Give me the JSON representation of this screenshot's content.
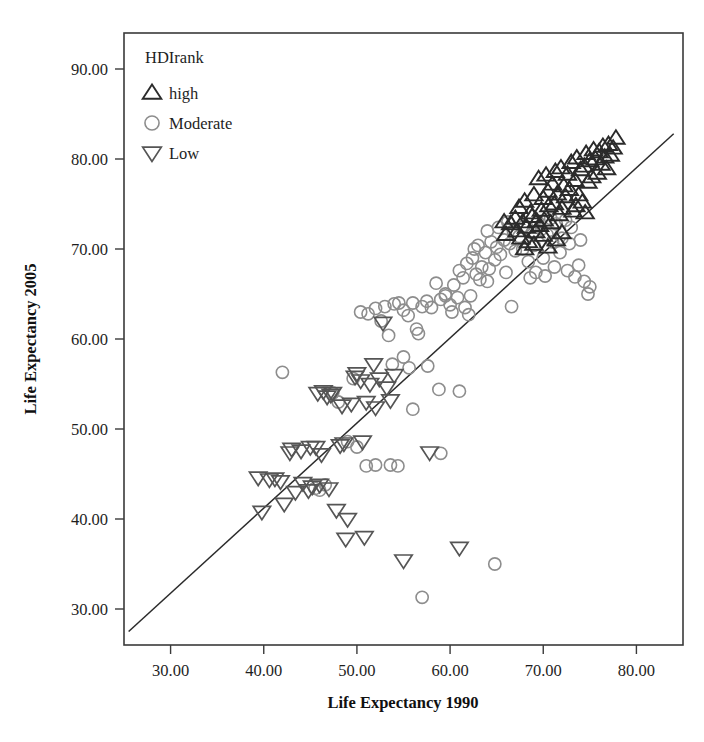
{
  "chart_data": {
    "type": "scatter",
    "title": "",
    "xlabel": "Life Expectancy 1990",
    "ylabel": "Life Expectancy 2005",
    "xlim": [
      25,
      85
    ],
    "ylim": [
      26,
      94
    ],
    "xticks": [
      "30.00",
      "40.00",
      "50.00",
      "60.00",
      "70.00",
      "80.00"
    ],
    "xtick_values": [
      30,
      40,
      50,
      60,
      70,
      80
    ],
    "yticks": [
      "30.00",
      "40.00",
      "50.00",
      "60.00",
      "70.00",
      "80.00",
      "90.00"
    ],
    "ytick_values": [
      30,
      40,
      50,
      60,
      70,
      80,
      90
    ],
    "grid": false,
    "legend": {
      "title": "HDIrank",
      "position": "top-left-inside",
      "entries": [
        {
          "label": "high",
          "marker": "triangle-up",
          "color": "#2b2b2b"
        },
        {
          "label": "Moderate",
          "marker": "circle",
          "color": "#8d8d8d"
        },
        {
          "label": "Low",
          "marker": "triangle-down",
          "color": "#555555"
        }
      ]
    },
    "reference_line": {
      "description": "y = x identity line",
      "from": [
        25.5,
        27.5
      ],
      "to": [
        84.0,
        82.8
      ]
    },
    "series": [
      {
        "name": "high",
        "marker": "triangle-up",
        "color": "#2b2b2b",
        "points": [
          [
            66.5,
            72.8
          ],
          [
            67.0,
            73.4
          ],
          [
            67.2,
            72.0
          ],
          [
            67.4,
            74.6
          ],
          [
            67.6,
            71.2
          ],
          [
            67.8,
            73.0
          ],
          [
            68.0,
            75.3
          ],
          [
            68.2,
            72.4
          ],
          [
            68.4,
            70.8
          ],
          [
            68.6,
            74.0
          ],
          [
            68.8,
            73.6
          ],
          [
            69.0,
            76.0
          ],
          [
            69.2,
            71.9
          ],
          [
            69.3,
            73.1
          ],
          [
            69.5,
            77.8
          ],
          [
            69.6,
            72.6
          ],
          [
            69.8,
            74.3
          ],
          [
            70.0,
            75.6
          ],
          [
            70.1,
            73.2
          ],
          [
            70.3,
            78.2
          ],
          [
            70.5,
            76.4
          ],
          [
            70.6,
            74.8
          ],
          [
            70.8,
            72.9
          ],
          [
            71.0,
            77.2
          ],
          [
            71.2,
            75.0
          ],
          [
            71.3,
            78.6
          ],
          [
            71.5,
            76.1
          ],
          [
            71.7,
            73.8
          ],
          [
            71.9,
            79.0
          ],
          [
            72.0,
            74.5
          ],
          [
            72.2,
            77.0
          ],
          [
            72.4,
            75.8
          ],
          [
            72.6,
            78.3
          ],
          [
            72.8,
            76.6
          ],
          [
            73.0,
            79.6
          ],
          [
            73.2,
            74.2
          ],
          [
            73.4,
            77.6
          ],
          [
            73.6,
            80.1
          ],
          [
            73.8,
            76.0
          ],
          [
            74.0,
            78.8
          ],
          [
            74.2,
            75.2
          ],
          [
            74.4,
            79.2
          ],
          [
            74.6,
            80.6
          ],
          [
            74.8,
            77.4
          ],
          [
            75.0,
            79.8
          ],
          [
            75.2,
            78.0
          ],
          [
            75.4,
            81.0
          ],
          [
            75.6,
            80.0
          ],
          [
            75.8,
            78.4
          ],
          [
            76.0,
            80.8
          ],
          [
            76.2,
            79.4
          ],
          [
            76.4,
            81.4
          ],
          [
            76.6,
            80.2
          ],
          [
            76.8,
            78.9
          ],
          [
            77.0,
            81.6
          ],
          [
            77.2,
            80.4
          ],
          [
            77.5,
            81.2
          ],
          [
            77.8,
            82.3
          ],
          [
            70.0,
            71.5
          ],
          [
            71.4,
            71.0
          ],
          [
            69.0,
            70.5
          ],
          [
            68.0,
            70.0
          ],
          [
            72.0,
            71.8
          ],
          [
            66.0,
            71.6
          ],
          [
            65.8,
            73.0
          ],
          [
            73.5,
            74.8
          ],
          [
            74.5,
            74.0
          ],
          [
            70.5,
            70.2
          ]
        ]
      },
      {
        "name": "Moderate",
        "marker": "circle",
        "color": "#8d8d8d",
        "points": [
          [
            42.0,
            56.3
          ],
          [
            52.0,
            63.4
          ],
          [
            52.6,
            62.0
          ],
          [
            53.0,
            63.6
          ],
          [
            53.4,
            60.4
          ],
          [
            54.0,
            63.9
          ],
          [
            54.5,
            64.0
          ],
          [
            55.0,
            63.2
          ],
          [
            55.5,
            62.6
          ],
          [
            56.0,
            64.0
          ],
          [
            56.4,
            61.1
          ],
          [
            57.0,
            63.6
          ],
          [
            57.5,
            64.2
          ],
          [
            58.0,
            63.5
          ],
          [
            58.5,
            66.2
          ],
          [
            59.0,
            64.4
          ],
          [
            59.5,
            65.0
          ],
          [
            60.0,
            63.8
          ],
          [
            60.4,
            66.0
          ],
          [
            60.8,
            64.6
          ],
          [
            61.0,
            67.6
          ],
          [
            61.4,
            66.8
          ],
          [
            61.8,
            68.4
          ],
          [
            62.0,
            62.7
          ],
          [
            62.4,
            69.0
          ],
          [
            62.8,
            67.2
          ],
          [
            63.0,
            70.4
          ],
          [
            63.4,
            68.0
          ],
          [
            63.8,
            69.6
          ],
          [
            64.0,
            66.4
          ],
          [
            64.4,
            70.8
          ],
          [
            64.8,
            68.8
          ],
          [
            65.0,
            70.2
          ],
          [
            65.4,
            69.4
          ],
          [
            65.8,
            71.0
          ],
          [
            66.0,
            67.4
          ],
          [
            66.4,
            70.6
          ],
          [
            66.8,
            72.0
          ],
          [
            67.0,
            69.8
          ],
          [
            67.4,
            71.4
          ],
          [
            67.8,
            70.0
          ],
          [
            68.0,
            72.6
          ],
          [
            68.4,
            68.6
          ],
          [
            68.8,
            71.8
          ],
          [
            69.0,
            70.4
          ],
          [
            69.4,
            73.0
          ],
          [
            69.8,
            72.2
          ],
          [
            70.0,
            69.0
          ],
          [
            70.4,
            71.6
          ],
          [
            70.8,
            73.4
          ],
          [
            71.0,
            70.8
          ],
          [
            71.4,
            72.8
          ],
          [
            71.8,
            69.6
          ],
          [
            72.0,
            71.2
          ],
          [
            72.4,
            73.2
          ],
          [
            72.8,
            70.6
          ],
          [
            73.0,
            72.4
          ],
          [
            73.4,
            66.9
          ],
          [
            73.8,
            68.2
          ],
          [
            74.0,
            71.0
          ],
          [
            74.4,
            66.4
          ],
          [
            74.8,
            65.0
          ],
          [
            75.0,
            65.8
          ],
          [
            62.6,
            70.0
          ],
          [
            63.2,
            66.6
          ],
          [
            64.2,
            67.8
          ],
          [
            66.6,
            63.6
          ],
          [
            58.8,
            54.4
          ],
          [
            61.0,
            54.2
          ],
          [
            56.0,
            52.2
          ],
          [
            55.6,
            56.8
          ],
          [
            59.0,
            47.3
          ],
          [
            64.8,
            35.0
          ],
          [
            57.0,
            31.3
          ],
          [
            53.6,
            46.0
          ],
          [
            50.0,
            48.0
          ],
          [
            49.0,
            48.6
          ],
          [
            46.6,
            43.8
          ],
          [
            46.0,
            43.2
          ],
          [
            51.0,
            45.9
          ],
          [
            52.0,
            46.0
          ],
          [
            54.4,
            45.9
          ],
          [
            45.5,
            43.4
          ],
          [
            59.5,
            64.8
          ],
          [
            60.2,
            63.0
          ],
          [
            57.6,
            57.0
          ],
          [
            56.6,
            60.6
          ],
          [
            50.4,
            63.0
          ],
          [
            51.2,
            62.8
          ],
          [
            53.8,
            57.2
          ],
          [
            55.0,
            58.0
          ],
          [
            49.6,
            55.6
          ],
          [
            48.0,
            53.0
          ],
          [
            47.4,
            54.0
          ],
          [
            61.6,
            63.5
          ],
          [
            62.2,
            64.8
          ],
          [
            64.0,
            72.0
          ],
          [
            65.2,
            72.4
          ],
          [
            66.2,
            73.0
          ],
          [
            68.6,
            66.8
          ],
          [
            69.2,
            67.4
          ],
          [
            70.2,
            67.0
          ],
          [
            71.2,
            68.0
          ],
          [
            72.6,
            67.6
          ]
        ]
      },
      {
        "name": "Low",
        "marker": "triangle-down",
        "color": "#555555",
        "points": [
          [
            39.4,
            44.6
          ],
          [
            39.8,
            40.8
          ],
          [
            40.6,
            44.4
          ],
          [
            41.2,
            44.5
          ],
          [
            41.8,
            44.2
          ],
          [
            42.2,
            41.7
          ],
          [
            43.0,
            47.8
          ],
          [
            44.0,
            47.6
          ],
          [
            44.8,
            43.2
          ],
          [
            45.2,
            43.6
          ],
          [
            45.6,
            48.0
          ],
          [
            45.8,
            54.0
          ],
          [
            46.0,
            43.8
          ],
          [
            46.2,
            47.2
          ],
          [
            46.4,
            54.2
          ],
          [
            46.8,
            53.6
          ],
          [
            47.0,
            43.4
          ],
          [
            47.4,
            54.0
          ],
          [
            47.8,
            41.0
          ],
          [
            48.2,
            48.2
          ],
          [
            48.6,
            48.4
          ],
          [
            48.8,
            37.8
          ],
          [
            49.0,
            40.0
          ],
          [
            49.4,
            52.8
          ],
          [
            49.8,
            55.8
          ],
          [
            50.0,
            56.2
          ],
          [
            50.4,
            55.4
          ],
          [
            50.8,
            38.0
          ],
          [
            51.0,
            53.0
          ],
          [
            51.4,
            55.0
          ],
          [
            52.0,
            52.4
          ],
          [
            52.4,
            55.6
          ],
          [
            52.8,
            61.8
          ],
          [
            53.2,
            54.6
          ],
          [
            53.6,
            53.2
          ],
          [
            54.0,
            56.0
          ],
          [
            55.0,
            35.4
          ],
          [
            57.8,
            47.4
          ],
          [
            61.0,
            36.8
          ],
          [
            44.2,
            44.0
          ],
          [
            43.4,
            43.0
          ],
          [
            50.6,
            48.6
          ],
          [
            51.8,
            57.2
          ],
          [
            48.4,
            52.6
          ],
          [
            47.2,
            53.8
          ],
          [
            45.0,
            48.0
          ],
          [
            42.8,
            47.4
          ]
        ]
      }
    ]
  }
}
